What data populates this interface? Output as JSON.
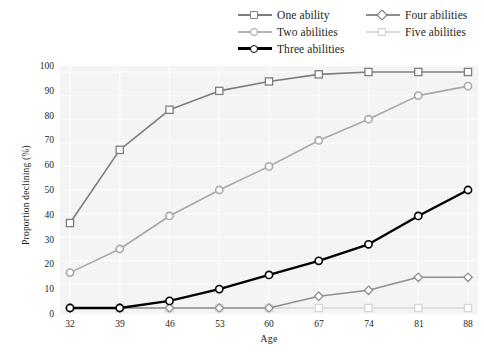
{
  "chart_data": {
    "type": "line",
    "title": "",
    "xlabel": "Age",
    "ylabel": "Proportion declining (%)",
    "x": [
      32,
      39,
      46,
      53,
      60,
      67,
      74,
      81,
      88
    ],
    "xlim": [
      32,
      88
    ],
    "ylim": [
      0,
      100
    ],
    "yticks": [
      0,
      10,
      20,
      30,
      40,
      50,
      60,
      70,
      80,
      90,
      100
    ],
    "xticks": [
      32,
      39,
      46,
      53,
      60,
      67,
      74,
      81,
      88
    ],
    "grid": true,
    "legend_position": "top",
    "series": [
      {
        "name": "One ability",
        "values": [
          36,
          67,
          84,
          92,
          96,
          99,
          100,
          100,
          100
        ],
        "color": "#7d7d7d",
        "marker": "square",
        "linewidth": 1.6
      },
      {
        "name": "Two abilities",
        "values": [
          15,
          25,
          39,
          50,
          60,
          71,
          80,
          90,
          94
        ],
        "color": "#a8a8a8",
        "marker": "circle",
        "linewidth": 1.6
      },
      {
        "name": "Three abilities",
        "values": [
          0,
          0,
          3,
          8,
          14,
          20,
          27,
          39,
          50
        ],
        "color": "#000000",
        "marker": "circle",
        "linewidth": 2.4
      },
      {
        "name": "Four abilities",
        "values": [
          0,
          0,
          0,
          0,
          0,
          5,
          7.5,
          13,
          13
        ],
        "color": "#8f8f8f",
        "marker": "diamond",
        "linewidth": 1.6
      },
      {
        "name": "Five abilities",
        "values": [
          0,
          0,
          0,
          0,
          0,
          0,
          0,
          0,
          0
        ],
        "color": "#d6d6d6",
        "marker": "square",
        "linewidth": 1.6
      }
    ]
  },
  "legend": {
    "entries": [
      {
        "label": "One ability"
      },
      {
        "label": "Four abilities"
      },
      {
        "label": "Two abilities"
      },
      {
        "label": "Five abilities"
      },
      {
        "label": "Three abilities"
      }
    ]
  },
  "axes": {
    "y_title": "Proportion declining (%)",
    "x_title": "Age",
    "y_tick_labels": [
      "100",
      "90",
      "80",
      "70",
      "60",
      "50",
      "40",
      "30",
      "20",
      "10",
      "0"
    ],
    "x_tick_labels": [
      "32",
      "39",
      "46",
      "53",
      "60",
      "67",
      "74",
      "81",
      "88"
    ]
  },
  "colors": {
    "plot_background": "#f4f4f4",
    "gridline": "#fbfbfb",
    "axis_text": "#231f20"
  }
}
